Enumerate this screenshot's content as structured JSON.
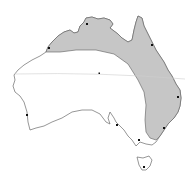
{
  "map": {
    "subject": "Australia",
    "shaded_region_color": "#c6c6c6",
    "land_color": "#ffffff",
    "coast_color": "#6a6a6a",
    "reference_line": "tropic-of-capricorn",
    "cities": [
      {
        "name": "broome",
        "x": 49,
        "y": 48
      },
      {
        "name": "darwin",
        "x": 87,
        "y": 24
      },
      {
        "name": "cairns",
        "x": 152,
        "y": 45
      },
      {
        "name": "alice-springs",
        "x": 99,
        "y": 73
      },
      {
        "name": "brisbane",
        "x": 178,
        "y": 97
      },
      {
        "name": "perth",
        "x": 27,
        "y": 115
      },
      {
        "name": "adelaide",
        "x": 117,
        "y": 125
      },
      {
        "name": "sydney",
        "x": 164,
        "y": 128
      },
      {
        "name": "melbourne",
        "x": 139,
        "y": 140
      },
      {
        "name": "hobart",
        "x": 144,
        "y": 167
      }
    ]
  }
}
